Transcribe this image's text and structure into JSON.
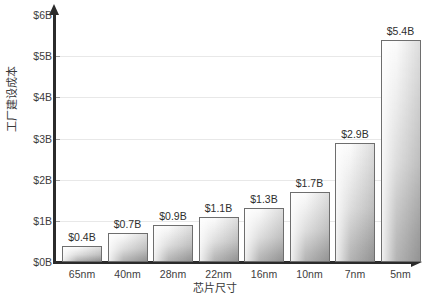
{
  "chart_data": {
    "type": "bar",
    "title": "",
    "xlabel": "芯片尺寸",
    "ylabel": "工厂建设成本",
    "categories": [
      "65nm",
      "40nm",
      "28nm",
      "22nm",
      "16nm",
      "10nm",
      "7nm",
      "5nm"
    ],
    "values": [
      0.4,
      0.7,
      0.9,
      1.1,
      1.3,
      1.7,
      2.9,
      5.4
    ],
    "value_labels": [
      "$0.4B",
      "$0.7B",
      "$0.9B",
      "$1.1B",
      "$1.3B",
      "$1.7B",
      "$2.9B",
      "$5.4B"
    ],
    "ylim": [
      0,
      6
    ],
    "y_ticks": [
      0,
      1,
      2,
      3,
      4,
      5,
      6
    ],
    "y_tick_labels": [
      "$0B",
      "$1B",
      "$2B",
      "$3B",
      "$4B",
      "$5B",
      "$6B"
    ],
    "grid": true,
    "grid_axis": "y",
    "legend": null,
    "units": "billions of USD",
    "colors": {
      "bar_fill_light": "#fafafa",
      "bar_fill_dark": "#9b9b9b",
      "bar_border": "#6e6e6e",
      "axis": "#2b2b2b",
      "gridline": "#e8e8e8",
      "text": "#3d3d3d"
    }
  }
}
